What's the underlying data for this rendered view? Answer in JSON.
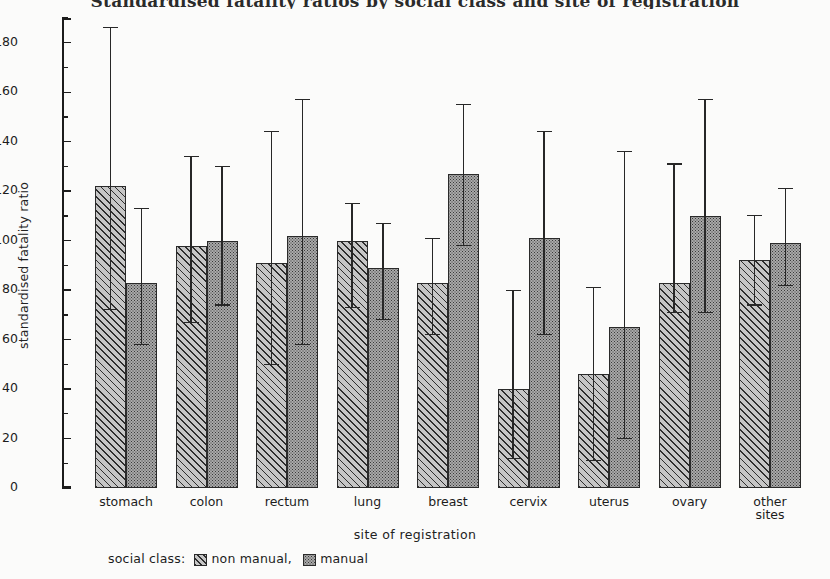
{
  "chart_data": {
    "type": "bar",
    "title": "Standardised fatality ratios by social class and site of registration",
    "xlabel": "site of registration",
    "ylabel": "standardised fatality ratio",
    "categories": [
      "stomach",
      "colon",
      "rectum",
      "lung",
      "breast",
      "cervix",
      "uterus",
      "ovary",
      "other\nsites"
    ],
    "ylim": [
      0,
      190
    ],
    "yticks": [
      0,
      20,
      40,
      60,
      80,
      100,
      120,
      140,
      160,
      180
    ],
    "yticklabels": [
      "0",
      "20",
      "40",
      "60",
      "80",
      "100",
      "120",
      "140",
      "160",
      "180"
    ],
    "minor_tick_step": 10,
    "grid": false,
    "legend": {
      "prefix": "social class:",
      "entries": [
        {
          "label": "non manual,",
          "pattern": "diagonal-hatch"
        },
        {
          "label": "manual",
          "pattern": "stipple-dots"
        }
      ],
      "position": "below-axis-left"
    },
    "series": [
      {
        "name": "non manual",
        "pattern": "diagonal-hatch",
        "values": [
          122,
          98,
          91,
          100,
          83,
          40,
          46,
          83,
          92
        ],
        "ci_lower": [
          72,
          67,
          50,
          73,
          62,
          12,
          11,
          71,
          74
        ],
        "ci_upper": [
          186,
          134,
          144,
          115,
          101,
          80,
          81,
          131,
          110
        ]
      },
      {
        "name": "manual",
        "pattern": "stipple-dots",
        "values": [
          83,
          100,
          102,
          89,
          127,
          101,
          65,
          110,
          99
        ],
        "ci_lower": [
          58,
          74,
          58,
          68,
          98,
          62,
          20,
          71,
          82
        ],
        "ci_upper": [
          113,
          130,
          157,
          107,
          155,
          144,
          136,
          157,
          121
        ]
      }
    ]
  }
}
